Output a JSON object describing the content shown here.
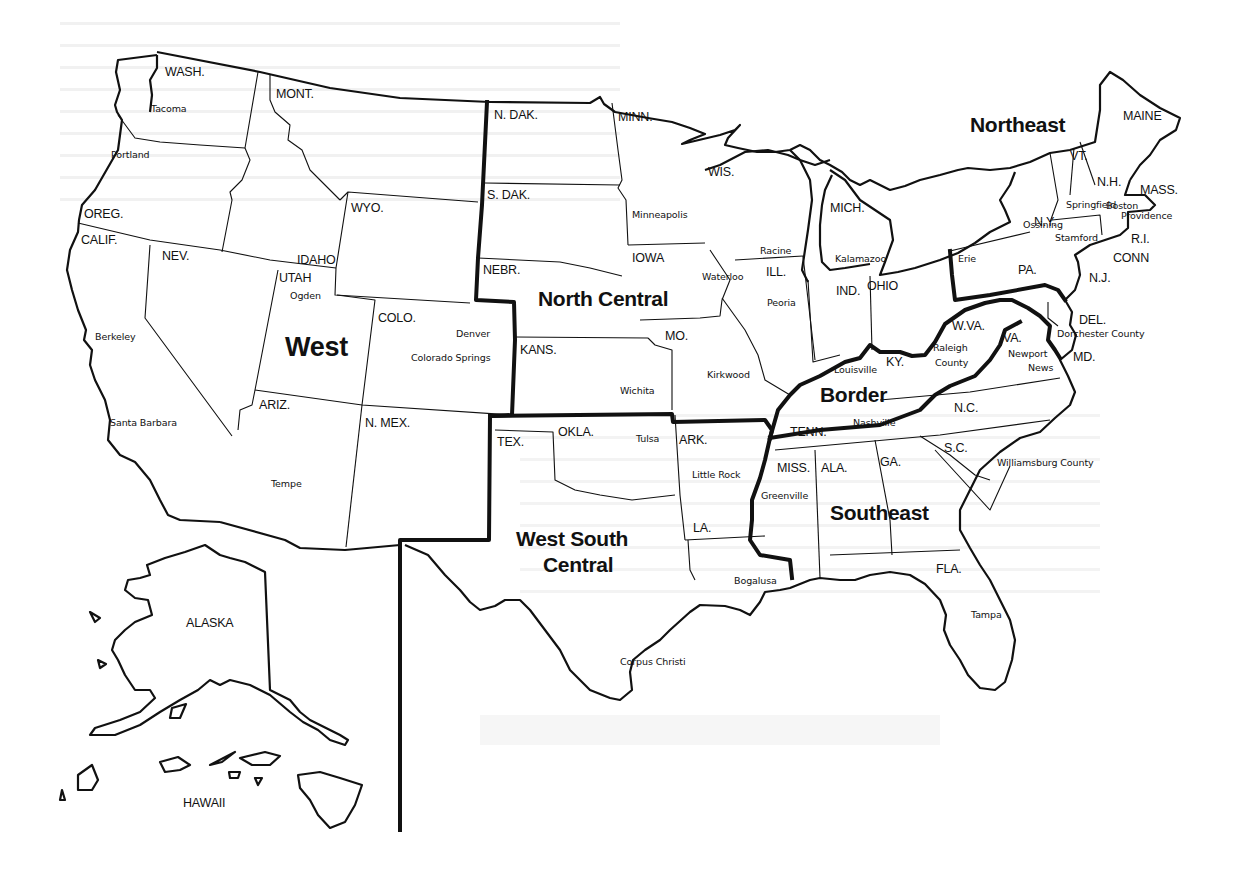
{
  "map": {
    "title_hidden": "",
    "colors": {
      "ink": "#111111",
      "paper": "#ffffff",
      "bleed": "#e9e9e9"
    },
    "regions": [
      {
        "id": "west",
        "label": "West",
        "x": 285,
        "y": 356,
        "size": "lg"
      },
      {
        "id": "north-central",
        "label": "North Central",
        "x": 538,
        "y": 306,
        "size": "md"
      },
      {
        "id": "northeast",
        "label": "Northeast",
        "x": 970,
        "y": 132,
        "size": "md"
      },
      {
        "id": "border",
        "label": "Border",
        "x": 820,
        "y": 402,
        "size": "md"
      },
      {
        "id": "southeast",
        "label": "Southeast",
        "x": 830,
        "y": 520,
        "size": "md"
      },
      {
        "id": "west-south-central-1",
        "label": "West South",
        "x": 516,
        "y": 546,
        "size": "md"
      },
      {
        "id": "west-south-central-2",
        "label": "Central",
        "x": 543,
        "y": 572,
        "size": "md"
      }
    ],
    "states": [
      {
        "label": "WASH.",
        "x": 165,
        "y": 76
      },
      {
        "label": "MONT.",
        "x": 276,
        "y": 98
      },
      {
        "label": "OREG.",
        "x": 84,
        "y": 218
      },
      {
        "label": "CALIF.",
        "x": 81,
        "y": 244
      },
      {
        "label": "NEV.",
        "x": 162,
        "y": 260
      },
      {
        "label": "IDAHO",
        "x": 297,
        "y": 264
      },
      {
        "label": "WYO.",
        "x": 351,
        "y": 212
      },
      {
        "label": "UTAH",
        "x": 279,
        "y": 282
      },
      {
        "label": "COLO.",
        "x": 378,
        "y": 322
      },
      {
        "label": "ARIZ.",
        "x": 259,
        "y": 409
      },
      {
        "label": "N. MEX.",
        "x": 365,
        "y": 427
      },
      {
        "label": "N. DAK.",
        "x": 494,
        "y": 119
      },
      {
        "label": "S. DAK.",
        "x": 487,
        "y": 199
      },
      {
        "label": "NEBR.",
        "x": 483,
        "y": 274
      },
      {
        "label": "KANS.",
        "x": 520,
        "y": 354
      },
      {
        "label": "MINN.",
        "x": 618,
        "y": 121
      },
      {
        "label": "IOWA",
        "x": 632,
        "y": 262
      },
      {
        "label": "MO.",
        "x": 665,
        "y": 340
      },
      {
        "label": "WIS.",
        "x": 708,
        "y": 176
      },
      {
        "label": "ILL.",
        "x": 766,
        "y": 276
      },
      {
        "label": "MICH.",
        "x": 830,
        "y": 212
      },
      {
        "label": "IND.",
        "x": 836,
        "y": 295
      },
      {
        "label": "OHIO",
        "x": 867,
        "y": 290
      },
      {
        "label": "TEX.",
        "x": 497,
        "y": 446
      },
      {
        "label": "OKLA.",
        "x": 558,
        "y": 436
      },
      {
        "label": "ARK.",
        "x": 679,
        "y": 444
      },
      {
        "label": "LA.",
        "x": 693,
        "y": 532
      },
      {
        "label": "TENN.",
        "x": 790,
        "y": 436
      },
      {
        "label": "MISS.",
        "x": 777,
        "y": 472
      },
      {
        "label": "ALA.",
        "x": 821,
        "y": 472
      },
      {
        "label": "GA.",
        "x": 880,
        "y": 466
      },
      {
        "label": "S.C.",
        "x": 944,
        "y": 452
      },
      {
        "label": "N.C.",
        "x": 954,
        "y": 412
      },
      {
        "label": "FLA.",
        "x": 936,
        "y": 573
      },
      {
        "label": "KY.",
        "x": 886,
        "y": 366
      },
      {
        "label": "W.VA.",
        "x": 952,
        "y": 330
      },
      {
        "label": "VA.",
        "x": 1003,
        "y": 342
      },
      {
        "label": "MD.",
        "x": 1073,
        "y": 361
      },
      {
        "label": "DEL.",
        "x": 1079,
        "y": 324
      },
      {
        "label": "PA.",
        "x": 1018,
        "y": 274
      },
      {
        "label": "N.J.",
        "x": 1089,
        "y": 282
      },
      {
        "label": "N.Y.",
        "x": 1034,
        "y": 226
      },
      {
        "label": "CONN",
        "x": 1113,
        "y": 262
      },
      {
        "label": "R.I.",
        "x": 1131,
        "y": 243
      },
      {
        "label": "MASS.",
        "x": 1140,
        "y": 194
      },
      {
        "label": "N.H.",
        "x": 1097,
        "y": 186
      },
      {
        "label": "VT.",
        "x": 1070,
        "y": 160
      },
      {
        "label": "MAINE",
        "x": 1123,
        "y": 120
      },
      {
        "label": "ALASKA",
        "x": 186,
        "y": 627
      },
      {
        "label": "HAWAII",
        "x": 183,
        "y": 807
      }
    ],
    "cities": [
      {
        "label": "Tacoma",
        "x": 151,
        "y": 112
      },
      {
        "label": "Portland",
        "x": 111,
        "y": 158
      },
      {
        "label": "Ogden",
        "x": 290,
        "y": 299
      },
      {
        "label": "Berkeley",
        "x": 95,
        "y": 340
      },
      {
        "label": "Denver",
        "x": 456,
        "y": 337
      },
      {
        "label": "Colorado Springs",
        "x": 411,
        "y": 361
      },
      {
        "label": "Santa Barbara",
        "x": 110,
        "y": 426
      },
      {
        "label": "Tempe",
        "x": 271,
        "y": 487
      },
      {
        "label": "Minneapolis",
        "x": 632,
        "y": 218
      },
      {
        "label": "Waterloo",
        "x": 702,
        "y": 280
      },
      {
        "label": "Racine",
        "x": 760,
        "y": 254
      },
      {
        "label": "Peoria",
        "x": 767,
        "y": 306
      },
      {
        "label": "Kalamazoo",
        "x": 835,
        "y": 262
      },
      {
        "label": "Erie",
        "x": 958,
        "y": 262
      },
      {
        "label": "Ossining",
        "x": 1023,
        "y": 228
      },
      {
        "label": "Springfield",
        "x": 1066,
        "y": 208
      },
      {
        "label": "Boston",
        "x": 1106,
        "y": 209
      },
      {
        "label": "Providence",
        "x": 1121,
        "y": 219
      },
      {
        "label": "Stamford",
        "x": 1055,
        "y": 241
      },
      {
        "label": "Kirkwood",
        "x": 707,
        "y": 378
      },
      {
        "label": "Wichita",
        "x": 620,
        "y": 394
      },
      {
        "label": "Louisville",
        "x": 834,
        "y": 373
      },
      {
        "label": "Raleigh",
        "x": 933,
        "y": 351
      },
      {
        "label": "County",
        "x": 935,
        "y": 366
      },
      {
        "label": "Newport",
        "x": 1008,
        "y": 357
      },
      {
        "label": "News",
        "x": 1028,
        "y": 371
      },
      {
        "label": "Dorchester County",
        "x": 1057,
        "y": 337
      },
      {
        "label": "Tulsa",
        "x": 636,
        "y": 442
      },
      {
        "label": "Little Rock",
        "x": 692,
        "y": 478
      },
      {
        "label": "Nashville",
        "x": 853,
        "y": 426
      },
      {
        "label": "Greenville",
        "x": 761,
        "y": 499
      },
      {
        "label": "Williamsburg County",
        "x": 997,
        "y": 466
      },
      {
        "label": "Bogalusa",
        "x": 734,
        "y": 584
      },
      {
        "label": "Tampa",
        "x": 971,
        "y": 618
      },
      {
        "label": "Corpus Christi",
        "x": 620,
        "y": 665
      }
    ]
  }
}
